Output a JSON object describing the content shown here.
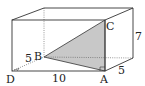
{
  "diagram": {
    "type": "rectangular prism with shaded triangle",
    "vertices": {
      "A": "A",
      "B": "B",
      "C": "C",
      "D": "D"
    },
    "dimensions": {
      "length": "10",
      "width_front": "5",
      "width_left": "5",
      "height": "7"
    },
    "colors": {
      "edge": "#333333",
      "hidden_edge": "#555555",
      "shaded_triangle": "#c8c8c8"
    }
  }
}
